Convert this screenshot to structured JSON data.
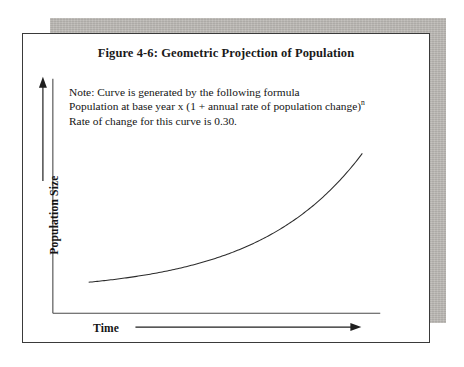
{
  "figure": {
    "title": "Figure 4-6: Geometric Projection of Population",
    "note": {
      "line1": "Note: Curve is generated by the following formula",
      "line2_main": "Population at base year x (1 + annual rate of population change)",
      "line2_sup": "n",
      "line3": "Rate of change for this curve is 0.30."
    },
    "axes": {
      "y_label": "Population Size",
      "x_label": "Time"
    },
    "colors": {
      "ink": "#141414",
      "frame_border": "#3a3a3a",
      "paper": "#ffffff",
      "shadow": "#b9b6b2",
      "curve": "#2b2b2b"
    }
  },
  "chart_data": {
    "type": "line",
    "title": "Figure 4-6: Geometric Projection of Population",
    "xlabel": "Time",
    "ylabel": "Population Size",
    "grid": false,
    "legend": false,
    "annotations": [
      "Note: Curve is generated by the following formula",
      "Population at base year x (1 + annual rate of population change)^n",
      "Rate of change for this curve is 0.30."
    ],
    "formula": "P_n = P_base * (1 + r)^n",
    "rate_of_change": 0.3,
    "axis_ticks": {
      "x": [],
      "y": []
    },
    "xlim": [
      0,
      10
    ],
    "ylim": [
      0,
      14
    ],
    "series": [
      {
        "name": "Geometric projection (r = 0.30)",
        "x": [
          0,
          1,
          2,
          3,
          4,
          5,
          6,
          7,
          8,
          9,
          10
        ],
        "values": [
          1.0,
          1.3,
          1.69,
          2.2,
          2.86,
          3.71,
          4.83,
          6.27,
          8.16,
          10.6,
          13.79
        ]
      }
    ]
  }
}
